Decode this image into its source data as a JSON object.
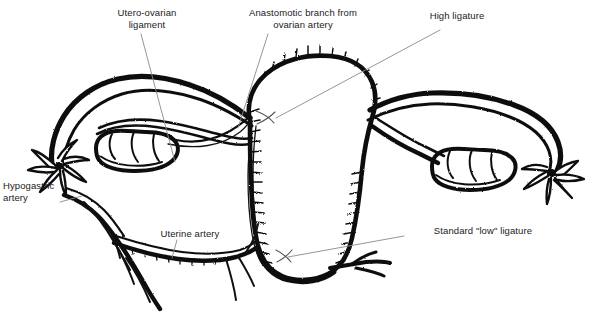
{
  "figure": {
    "background_color": "#ffffff",
    "ink_color": "#111111",
    "leader_color": "#8a8a8a"
  },
  "labels": [
    {
      "id": "utero-ovarian-ligament",
      "text": "Utero-ovarian\nligament",
      "align": "center"
    },
    {
      "id": "anastomotic-branch",
      "text": "Anastomotic branch from\novarian artery",
      "align": "center"
    },
    {
      "id": "high-ligature",
      "text": "High ligature",
      "align": "center"
    },
    {
      "id": "hypogastric-artery",
      "text": "Hypogastric\nartery",
      "align": "left"
    },
    {
      "id": "uterine-artery",
      "text": "Uterine artery",
      "align": "center"
    },
    {
      "id": "standard-low-ligature",
      "text": "Standard \"low\" ligature",
      "align": "center"
    }
  ],
  "structures": [
    {
      "id": "uterus-body",
      "name": "uterus"
    },
    {
      "id": "left-fallopian-tube",
      "name": "fallopian tube (left)"
    },
    {
      "id": "right-fallopian-tube",
      "name": "fallopian tube (right)"
    },
    {
      "id": "left-ovary",
      "name": "ovary (left)"
    },
    {
      "id": "right-ovary",
      "name": "ovary (right)"
    },
    {
      "id": "left-fimbriae",
      "name": "fimbriae (left)"
    },
    {
      "id": "right-fimbriae",
      "name": "fimbriae (right)"
    },
    {
      "id": "hypogastric-artery-vessel",
      "name": "hypogastric artery"
    },
    {
      "id": "uterine-artery-vessel",
      "name": "uterine artery"
    },
    {
      "id": "cervix",
      "name": "cervix"
    }
  ],
  "ligature_marks": [
    {
      "id": "high-ligature-mark",
      "symbol": "X"
    },
    {
      "id": "low-ligature-mark",
      "symbol": "X"
    }
  ]
}
